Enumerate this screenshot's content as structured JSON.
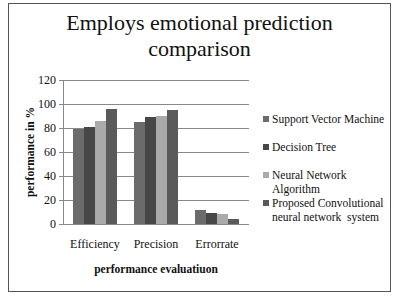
{
  "chart_data": {
    "type": "bar",
    "title": "Employs emotional prediction comparison",
    "title_lines": [
      "Employs emotional prediction",
      "comparison"
    ],
    "xlabel": "performance evaluatiuon",
    "ylabel": "performance in %",
    "ylim": [
      0,
      120
    ],
    "yticks": [
      0,
      20,
      40,
      60,
      80,
      100,
      120
    ],
    "grid": true,
    "legend_position": "right",
    "categories": [
      "Efficiency",
      "Precision",
      "Error rate"
    ],
    "series": [
      {
        "name": "Support Vector Machine",
        "color": "#6b6b6b",
        "values": [
          79,
          85,
          12
        ]
      },
      {
        "name": "Decision Tree",
        "color": "#474747",
        "values": [
          81,
          89,
          9
        ]
      },
      {
        "name": "Neural Network Algorithm",
        "color": "#aaaaaa",
        "values": [
          86,
          90,
          8
        ]
      },
      {
        "name": "Proposed Convolutional neural network  system",
        "color": "#5a5a5a",
        "values": [
          96,
          95,
          4
        ]
      }
    ]
  },
  "labels": {
    "title_line1": "Employs emotional prediction",
    "title_line2": "comparison",
    "xlabel": "performance evaluatiuon",
    "ylabel": "performance in %",
    "categories": [
      "Efficiency",
      "Precision",
      "Errorrate"
    ],
    "yticks": [
      "0",
      "20",
      "40",
      "60",
      "80",
      "100",
      "120"
    ],
    "legend": [
      {
        "line1": "Support Vector Machine"
      },
      {
        "line1": "Decision Tree"
      },
      {
        "line1": "Neural Network Algorithm"
      },
      {
        "line1": "Proposed Convolutional",
        "line2": "neural network  system"
      }
    ]
  }
}
